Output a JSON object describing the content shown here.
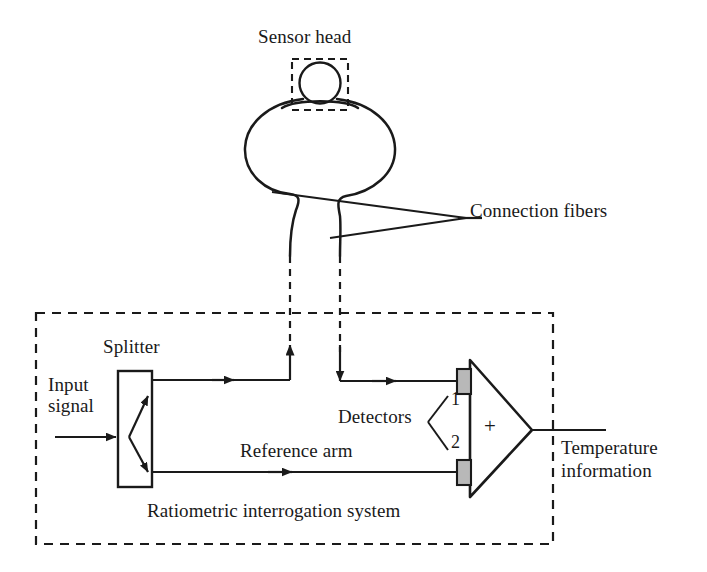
{
  "diagram": {
    "title_labels": {
      "sensor_head": "Sensor head",
      "connection_fibers": "Connection fibers",
      "splitter": "Splitter",
      "input_signal": "Input\nsignal",
      "detectors": "Detectors",
      "detector_1": "1",
      "detector_2": "2",
      "amplifier_symbol": "+",
      "reference_arm": "Reference arm",
      "system_box": "Ratiometric interrogation system",
      "output": "Temperature\ninformation"
    },
    "colors": {
      "line": "#1a1a1a",
      "detector_fill": "#b8b8b8",
      "background": "#ffffff",
      "dashed": "#1a1a1a"
    }
  }
}
